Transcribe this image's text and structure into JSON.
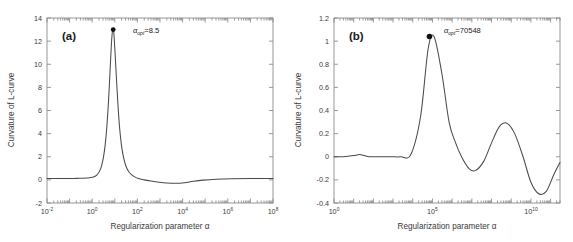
{
  "figure": {
    "background": "#ffffff",
    "curve_color": "#4a4a4a",
    "axis_color": "#8d8d8d",
    "text_color": "#3a3a3a",
    "marker_color": "#111111"
  },
  "chart_data": [
    {
      "type": "line",
      "panel_tag": "(a)",
      "title": "",
      "xlabel": "Regularization parameter α",
      "ylabel": "Curvature of L-curve",
      "xscale": "log",
      "xlim": [
        0.01,
        100000000
      ],
      "ylim": [
        -2,
        14
      ],
      "grid": false,
      "legend": "none",
      "xticks": [
        0.01,
        1,
        100,
        10000,
        1000000,
        100000000
      ],
      "xtick_labels": [
        "10-2",
        "100",
        "102",
        "104",
        "106",
        "108"
      ],
      "xtick_mantissas": [
        "10",
        "10",
        "10",
        "10",
        "10",
        "10"
      ],
      "xtick_exponents": [
        "-2",
        "0",
        "2",
        "4",
        "6",
        "8"
      ],
      "yticks": [
        -2,
        0,
        2,
        4,
        6,
        8,
        10,
        12,
        14
      ],
      "ytick_labels": [
        "-2",
        "0",
        "2",
        "4",
        "6",
        "8",
        "10",
        "12",
        "14"
      ],
      "annotation": {
        "symbol": "α",
        "subscript": "opt",
        "equals_value": "=8.5",
        "full_text": "αopt=8.5",
        "value": 8.5
      },
      "marker_point": {
        "x": 8.5,
        "y": 13.0
      },
      "series": [
        {
          "name": "curvature-a",
          "x": [
            0.01,
            0.02,
            0.04,
            0.07,
            0.12,
            0.2,
            0.35,
            0.6,
            1.0,
            1.6,
            2.4,
            3.3,
            4.2,
            5.2,
            6.2,
            7.0,
            7.7,
            8.2,
            8.5,
            8.9,
            9.4,
            10.2,
            11.5,
            13.5,
            16.0,
            20.0,
            26.0,
            34.0,
            48.0,
            70.0,
            110.0,
            200.0,
            400.0,
            900.0,
            2000.0,
            5000.0,
            12000.0,
            30000.0,
            80000.0,
            300000.0,
            1500000.0,
            10000000.0,
            100000000.0
          ],
          "y": [
            0.12,
            0.12,
            0.12,
            0.12,
            0.12,
            0.13,
            0.14,
            0.16,
            0.22,
            0.42,
            1.0,
            2.2,
            4.0,
            6.6,
            9.5,
            11.6,
            12.7,
            12.95,
            13.0,
            12.85,
            12.3,
            11.1,
            9.2,
            6.8,
            4.7,
            2.9,
            1.7,
            1.0,
            0.55,
            0.3,
            0.12,
            0.0,
            -0.1,
            -0.2,
            -0.27,
            -0.3,
            -0.25,
            -0.12,
            -0.02,
            0.06,
            0.1,
            0.12,
            0.12
          ]
        }
      ]
    },
    {
      "type": "line",
      "panel_tag": "(b)",
      "title": "",
      "xlabel": "Regularization parameter α",
      "ylabel": "Curvature of L-curve",
      "xscale": "log",
      "xlim": [
        1,
        300000000000
      ],
      "ylim": [
        -0.4,
        1.2
      ],
      "grid": false,
      "legend": "none",
      "xticks": [
        1,
        100000,
        10000000000
      ],
      "xtick_labels": [
        "100",
        "105",
        "1010"
      ],
      "xtick_mantissas": [
        "10",
        "10",
        "10"
      ],
      "xtick_exponents": [
        "0",
        "5",
        "10"
      ],
      "yticks": [
        -0.4,
        -0.2,
        0,
        0.2,
        0.4,
        0.6,
        0.8,
        1.0,
        1.2
      ],
      "ytick_labels": [
        "-0.4",
        "-0.2",
        "0",
        "0.2",
        "0.4",
        "0.6",
        "0.8",
        "1",
        "1.2"
      ],
      "annotation": {
        "symbol": "α",
        "subscript": "opt",
        "equals_value": "=70548",
        "full_text": "αopt=70548",
        "value": 70548
      },
      "marker_point": {
        "x": 70548,
        "y": 1.04
      },
      "series": [
        {
          "name": "curvature-b",
          "x": [
            1,
            3,
            10,
            20,
            35,
            60,
            120,
            300,
            800,
            2500,
            8000,
            25000,
            60000,
            120000,
            300000,
            700000,
            1500000,
            3000000,
            7000000,
            15000000,
            40000000,
            100000000,
            250000000,
            600000000,
            1500000000,
            4000000000,
            10000000000,
            25000000000,
            60000000000,
            150000000000,
            300000000000
          ],
          "y": [
            0.0,
            0.0,
            0.01,
            0.02,
            0.01,
            0.0,
            0.0,
            0.0,
            0.0,
            0.0,
            0.02,
            0.35,
            0.93,
            1.04,
            0.72,
            0.3,
            0.12,
            0.0,
            -0.1,
            -0.12,
            -0.04,
            0.12,
            0.26,
            0.29,
            0.2,
            0.0,
            -0.22,
            -0.32,
            -0.3,
            -0.15,
            -0.05
          ]
        }
      ]
    }
  ]
}
